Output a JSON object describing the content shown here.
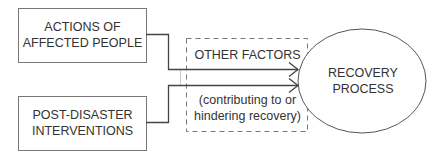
{
  "diagram": {
    "boxes": [
      {
        "id": "actions",
        "line1": "ACTIONS OF",
        "line2": "AFFECTED PEOPLE"
      },
      {
        "id": "interventions",
        "line1": "POST-DISASTER",
        "line2": "INTERVENTIONS"
      }
    ],
    "other_factors": {
      "title": "OTHER FACTORS",
      "line1": "(contributing to or",
      "line2": "hindering recovery)"
    },
    "outcome": {
      "line1": "RECOVERY",
      "line2": "PROCESS"
    },
    "colors": {
      "stroke": "#555555",
      "text": "#333333",
      "dash": "#777777"
    }
  }
}
